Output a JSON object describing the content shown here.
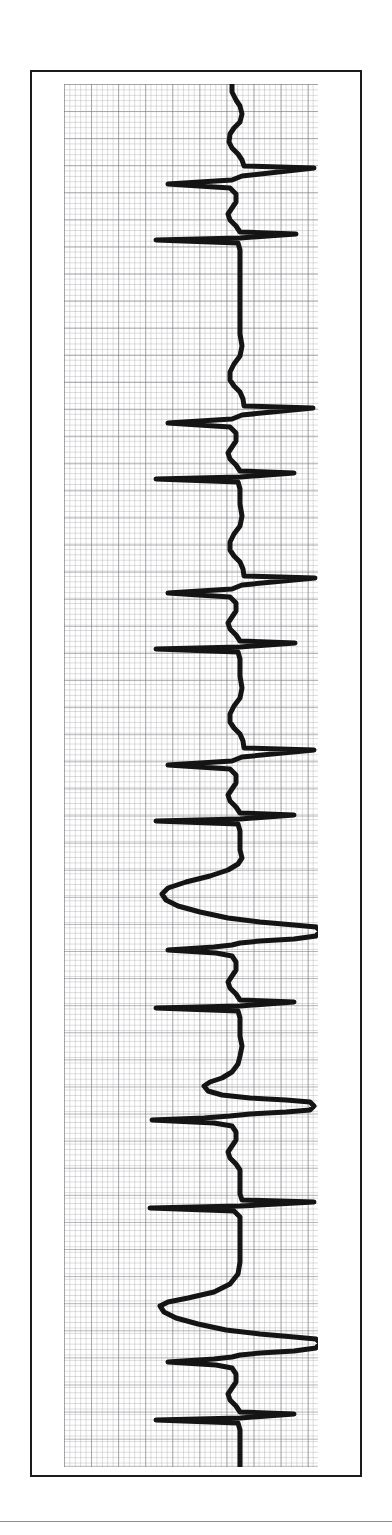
{
  "document": {
    "type": "ecg-rhythm-strip",
    "orientation": "rotated-90-vertical",
    "background_color": "#ffffff",
    "frame_color": "#1b1b1b",
    "trace_color": "#141414",
    "grid_major_color": "#78787d",
    "grid_minor_color": "#96969e"
  },
  "chart_data": {
    "type": "line",
    "title": "",
    "subtitle": "",
    "xlabel": "",
    "ylabel": "",
    "legend": [],
    "grid": true,
    "axis_note": "ECG graph paper: minor square = 1 mm, major square = 5 mm (5 minor squares)",
    "orientation": "vertical (time runs top to bottom, amplitude runs left to right)",
    "grid_minor_px": 5.42,
    "grid_major_px": 27.1,
    "baseline_x_px": 168,
    "time_axis_px": 1383,
    "beats": [
      {
        "index": 1,
        "label": "sinus-beat",
        "r_peak_t": 85,
        "qrs_width_px": 22,
        "r_amplitude_px": 130,
        "morphology": "narrow"
      },
      {
        "index": 2,
        "label": "sinus-beat",
        "r_peak_t": 268,
        "qrs_width_px": 22,
        "r_amplitude_px": 128,
        "morphology": "narrow"
      },
      {
        "index": 3,
        "label": "sinus-beat",
        "r_peak_t": 450,
        "qrs_width_px": 22,
        "r_amplitude_px": 128,
        "morphology": "narrow"
      },
      {
        "index": 4,
        "label": "sinus-beat",
        "r_peak_t": 630,
        "qrs_width_px": 22,
        "r_amplitude_px": 130,
        "morphology": "narrow"
      },
      {
        "index": 5,
        "label": "wide-bizarre-complex",
        "r_peak_t": 790,
        "qrs_width_px": 95,
        "r_amplitude_px": 150,
        "morphology": "wide"
      },
      {
        "index": 6,
        "label": "wide-complex",
        "r_peak_t": 960,
        "qrs_width_px": 70,
        "r_amplitude_px": 150,
        "morphology": "wide"
      },
      {
        "index": 7,
        "label": "wide-bizarre-complex",
        "r_peak_t": 1120,
        "qrs_width_px": 120,
        "r_amplitude_px": 155,
        "morphology": "wide"
      },
      {
        "index": 8,
        "label": "wide-bizarre-complex",
        "r_peak_t": 1300,
        "qrs_width_px": 120,
        "r_amplitude_px": 155,
        "morphology": "wide"
      }
    ],
    "path": [
      [
        168,
        0
      ],
      [
        168,
        8
      ],
      [
        172,
        16
      ],
      [
        176,
        22
      ],
      [
        178,
        30
      ],
      [
        176,
        38
      ],
      [
        170,
        44
      ],
      [
        166,
        50
      ],
      [
        165,
        58
      ],
      [
        168,
        64
      ],
      [
        174,
        70
      ],
      [
        178,
        76
      ],
      [
        180,
        82
      ],
      [
        250,
        84
      ],
      [
        178,
        92
      ],
      [
        168,
        96
      ],
      [
        104,
        100
      ],
      [
        166,
        104
      ],
      [
        172,
        110
      ],
      [
        172,
        118
      ],
      [
        168,
        124
      ],
      [
        164,
        130
      ],
      [
        166,
        136
      ],
      [
        172,
        142
      ],
      [
        176,
        148
      ],
      [
        232,
        150
      ],
      [
        176,
        154
      ],
      [
        92,
        156
      ],
      [
        174,
        159
      ],
      [
        176,
        166
      ],
      [
        176,
        230
      ],
      [
        176,
        250
      ],
      [
        178,
        262
      ],
      [
        176,
        272
      ],
      [
        170,
        280
      ],
      [
        166,
        288
      ],
      [
        166,
        296
      ],
      [
        170,
        302
      ],
      [
        176,
        308
      ],
      [
        179,
        315
      ],
      [
        180,
        322
      ],
      [
        249,
        324
      ],
      [
        178,
        331
      ],
      [
        168,
        335
      ],
      [
        104,
        339
      ],
      [
        166,
        343
      ],
      [
        172,
        349
      ],
      [
        172,
        357
      ],
      [
        168,
        363
      ],
      [
        164,
        369
      ],
      [
        166,
        375
      ],
      [
        172,
        381
      ],
      [
        176,
        387
      ],
      [
        230,
        389
      ],
      [
        176,
        393
      ],
      [
        92,
        395
      ],
      [
        174,
        398
      ],
      [
        176,
        405
      ],
      [
        176,
        412
      ],
      [
        176,
        420
      ],
      [
        178,
        432
      ],
      [
        176,
        442
      ],
      [
        170,
        450
      ],
      [
        166,
        458
      ],
      [
        166,
        466
      ],
      [
        170,
        472
      ],
      [
        176,
        478
      ],
      [
        179,
        485
      ],
      [
        180,
        492
      ],
      [
        251,
        494
      ],
      [
        178,
        501
      ],
      [
        168,
        505
      ],
      [
        104,
        509
      ],
      [
        166,
        513
      ],
      [
        172,
        519
      ],
      [
        172,
        527
      ],
      [
        168,
        533
      ],
      [
        164,
        539
      ],
      [
        166,
        545
      ],
      [
        172,
        551
      ],
      [
        176,
        557
      ],
      [
        231,
        559
      ],
      [
        176,
        563
      ],
      [
        92,
        565
      ],
      [
        174,
        568
      ],
      [
        176,
        575
      ],
      [
        176,
        582
      ],
      [
        176,
        592
      ],
      [
        178,
        604
      ],
      [
        176,
        614
      ],
      [
        170,
        622
      ],
      [
        166,
        630
      ],
      [
        166,
        638
      ],
      [
        170,
        644
      ],
      [
        176,
        650
      ],
      [
        179,
        657
      ],
      [
        180,
        664
      ],
      [
        250,
        666
      ],
      [
        178,
        673
      ],
      [
        168,
        677
      ],
      [
        104,
        681
      ],
      [
        166,
        685
      ],
      [
        172,
        691
      ],
      [
        172,
        699
      ],
      [
        168,
        705
      ],
      [
        164,
        711
      ],
      [
        166,
        717
      ],
      [
        172,
        723
      ],
      [
        176,
        729
      ],
      [
        230,
        731
      ],
      [
        176,
        735
      ],
      [
        92,
        737
      ],
      [
        174,
        740
      ],
      [
        176,
        747
      ],
      [
        176,
        756
      ],
      [
        176,
        766
      ],
      [
        178,
        774
      ],
      [
        174,
        780
      ],
      [
        164,
        786
      ],
      [
        146,
        792
      ],
      [
        122,
        798
      ],
      [
        104,
        804
      ],
      [
        98,
        810
      ],
      [
        102,
        816
      ],
      [
        114,
        822
      ],
      [
        136,
        828
      ],
      [
        164,
        834
      ],
      [
        196,
        838
      ],
      [
        230,
        841
      ],
      [
        252,
        843
      ],
      [
        256,
        847
      ],
      [
        252,
        852
      ],
      [
        230,
        855
      ],
      [
        196,
        857
      ],
      [
        176,
        859
      ],
      [
        168,
        861
      ],
      [
        150,
        863
      ],
      [
        104,
        866
      ],
      [
        152,
        869
      ],
      [
        168,
        872
      ],
      [
        172,
        878
      ],
      [
        172,
        886
      ],
      [
        168,
        892
      ],
      [
        164,
        898
      ],
      [
        166,
        904
      ],
      [
        172,
        910
      ],
      [
        176,
        916
      ],
      [
        230,
        918
      ],
      [
        176,
        922
      ],
      [
        92,
        924
      ],
      [
        174,
        927
      ],
      [
        176,
        934
      ],
      [
        176,
        942
      ],
      [
        176,
        952
      ],
      [
        178,
        962
      ],
      [
        176,
        972
      ],
      [
        174,
        980
      ],
      [
        168,
        988
      ],
      [
        158,
        994
      ],
      [
        146,
        998
      ],
      [
        140,
        1002
      ],
      [
        144,
        1007
      ],
      [
        158,
        1011
      ],
      [
        186,
        1014
      ],
      [
        222,
        1016
      ],
      [
        246,
        1018
      ],
      [
        250,
        1022
      ],
      [
        246,
        1026
      ],
      [
        222,
        1028
      ],
      [
        186,
        1030
      ],
      [
        166,
        1032
      ],
      [
        140,
        1034
      ],
      [
        88,
        1036
      ],
      [
        150,
        1039
      ],
      [
        168,
        1042
      ],
      [
        172,
        1048
      ],
      [
        172,
        1056
      ],
      [
        168,
        1062
      ],
      [
        164,
        1068
      ],
      [
        166,
        1074
      ],
      [
        172,
        1080
      ],
      [
        176,
        1086
      ],
      [
        176,
        1094
      ],
      [
        176,
        1104
      ],
      [
        176,
        1110
      ],
      [
        178,
        1116
      ],
      [
        250,
        1118
      ],
      [
        176,
        1122
      ],
      [
        86,
        1124
      ],
      [
        170,
        1127
      ],
      [
        176,
        1133
      ],
      [
        176,
        1146
      ],
      [
        176,
        1162
      ],
      [
        176,
        1178
      ],
      [
        174,
        1190
      ],
      [
        166,
        1200
      ],
      [
        150,
        1208
      ],
      [
        124,
        1214
      ],
      [
        104,
        1218
      ],
      [
        96,
        1222
      ],
      [
        100,
        1228
      ],
      [
        112,
        1234
      ],
      [
        134,
        1240
      ],
      [
        162,
        1246
      ],
      [
        196,
        1250
      ],
      [
        230,
        1253
      ],
      [
        252,
        1255
      ],
      [
        256,
        1259
      ],
      [
        252,
        1264
      ],
      [
        230,
        1267
      ],
      [
        196,
        1269
      ],
      [
        176,
        1271
      ],
      [
        168,
        1273
      ],
      [
        150,
        1275
      ],
      [
        104,
        1278
      ],
      [
        152,
        1281
      ],
      [
        168,
        1284
      ],
      [
        172,
        1290
      ],
      [
        172,
        1298
      ],
      [
        168,
        1304
      ],
      [
        164,
        1310
      ],
      [
        166,
        1316
      ],
      [
        172,
        1322
      ],
      [
        176,
        1328
      ],
      [
        230,
        1330
      ],
      [
        176,
        1334
      ],
      [
        92,
        1336
      ],
      [
        174,
        1339
      ],
      [
        176,
        1346
      ],
      [
        176,
        1360
      ],
      [
        176,
        1383
      ]
    ],
    "path_wide_beats": [
      {
        "name": "beat-5-wide",
        "points": [
          [
            176,
            760
          ],
          [
            176,
            772
          ],
          [
            174,
            780
          ],
          [
            164,
            786
          ],
          [
            144,
            793
          ],
          [
            120,
            800
          ],
          [
            102,
            807
          ],
          [
            97,
            813
          ],
          [
            104,
            820
          ],
          [
            122,
            827
          ],
          [
            150,
            834
          ],
          [
            186,
            839
          ],
          [
            224,
            842
          ],
          [
            250,
            844
          ],
          [
            256,
            848
          ],
          [
            250,
            853
          ],
          [
            222,
            856
          ],
          [
            186,
            858
          ],
          [
            170,
            860
          ],
          [
            148,
            863
          ],
          [
            104,
            866
          ]
        ]
      },
      {
        "name": "beat-7-wide",
        "points": [
          [
            176,
            1176
          ],
          [
            174,
            1190
          ],
          [
            164,
            1201
          ],
          [
            146,
            1210
          ],
          [
            120,
            1216
          ],
          [
            100,
            1221
          ],
          [
            95,
            1227
          ],
          [
            104,
            1234
          ],
          [
            126,
            1241
          ],
          [
            158,
            1247
          ],
          [
            196,
            1251
          ],
          [
            232,
            1254
          ],
          [
            254,
            1256
          ],
          [
            257,
            1260
          ],
          [
            252,
            1265
          ],
          [
            230,
            1268
          ],
          [
            194,
            1270
          ],
          [
            172,
            1272
          ],
          [
            148,
            1275
          ],
          [
            104,
            1278
          ]
        ]
      }
    ]
  }
}
